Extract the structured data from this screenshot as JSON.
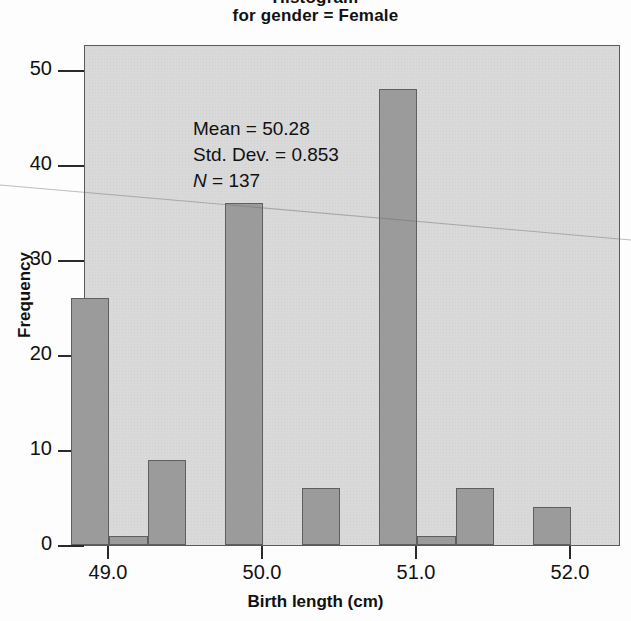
{
  "chart_data": {
    "type": "bar",
    "title": "Histogram",
    "subtitle": "for gender = Female",
    "xlabel": "Birth length (cm)",
    "ylabel": "Frequency",
    "xlim": [
      48.65,
      52.35
    ],
    "ylim": [
      0,
      53
    ],
    "grid": false,
    "legend": null,
    "bin_width": 0.25,
    "bin_centers": [
      48.875,
      49.125,
      49.375,
      49.875,
      50.375,
      50.875,
      51.125,
      51.375,
      51.875
    ],
    "bin_starts": [
      48.75,
      49.0,
      49.25,
      49.75,
      50.25,
      50.75,
      51.0,
      51.25,
      51.75
    ],
    "values": [
      26,
      1,
      9,
      36,
      6,
      48,
      1,
      6,
      4
    ],
    "xticks": [
      49.0,
      50.0,
      51.0,
      52.0
    ],
    "xtick_labels": [
      "49.0",
      "50.0",
      "51.0",
      "52.0"
    ],
    "yticks": [
      0,
      10,
      20,
      30,
      40,
      50
    ],
    "ytick_labels": [
      "0",
      "10",
      "20",
      "30",
      "40",
      "50"
    ],
    "annotations": {
      "mean_label": "Mean = 50.28",
      "std_label": "Std. Dev. = 0.853",
      "n_symbol": "N",
      "n_value": " = 137"
    },
    "statistics": {
      "mean": 50.28,
      "std_dev": 0.853,
      "n": 137
    },
    "colors": {
      "bar_fill": "#9b9b9b",
      "bar_edge": "#5f5f5f",
      "plot_background": "#d9d9d9",
      "frame": "#5a5a5a",
      "text": "#111111"
    }
  }
}
